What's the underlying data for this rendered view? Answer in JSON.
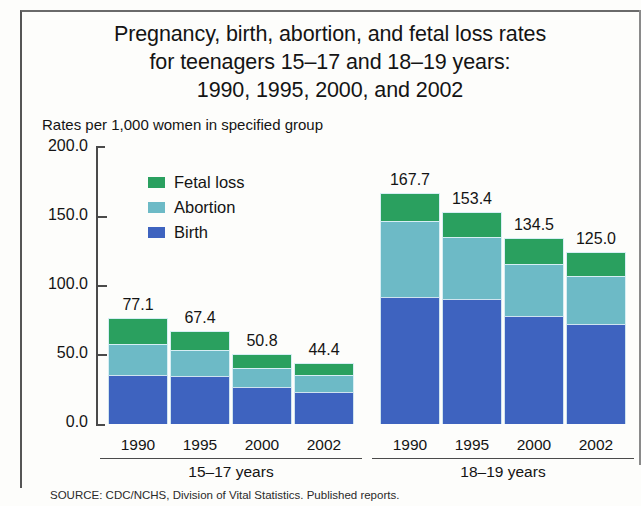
{
  "figure": {
    "title_lines": [
      "Pregnancy, birth, abortion, and fetal loss rates",
      "for teenagers 15–17 and 18–19 years:",
      "1990, 1995, 2000, and 2002"
    ],
    "subtitle": "Rates per 1,000 women in specified group",
    "source": "SOURCE: CDC/NCHS, Division of Vital Statistics. Published reports."
  },
  "legend": {
    "position": "inside-top-left",
    "items": [
      {
        "label": "Fetal loss",
        "color": "#2aa05f"
      },
      {
        "label": "Abortion",
        "color": "#6dbac6"
      },
      {
        "label": "Birth",
        "color": "#3e63bf"
      }
    ]
  },
  "axis": {
    "y_ticks": [
      "200.0",
      "150.0",
      "100.0",
      "50.0",
      "0.0"
    ],
    "y_values": [
      200,
      150,
      100,
      50,
      0
    ]
  },
  "groups": [
    {
      "label": "15–17 years",
      "years": [
        "1990",
        "1995",
        "2000",
        "2002"
      ]
    },
    {
      "label": "18–19 years",
      "years": [
        "1990",
        "1995",
        "2000",
        "2002"
      ]
    }
  ],
  "bars": [
    {
      "group": "15–17 years",
      "year": "1990",
      "total": "77.1",
      "birth": 35.5,
      "abortion": 22.2,
      "fetal_loss": 19.4
    },
    {
      "group": "15–17 years",
      "year": "1995",
      "total": "67.4",
      "birth": 35.1,
      "abortion": 18.8,
      "fetal_loss": 13.5
    },
    {
      "group": "15–17 years",
      "year": "2000",
      "total": "50.8",
      "birth": 26.9,
      "abortion": 13.8,
      "fetal_loss": 10.1
    },
    {
      "group": "15–17 years",
      "year": "2002",
      "total": "44.4",
      "birth": 23.2,
      "abortion": 12.3,
      "fetal_loss": 8.9
    },
    {
      "group": "18–19 years",
      "year": "1990",
      "total": "167.7",
      "birth": 92.0,
      "abortion": 55.3,
      "fetal_loss": 20.4
    },
    {
      "group": "18–19 years",
      "year": "1995",
      "total": "153.4",
      "birth": 90.6,
      "abortion": 44.8,
      "fetal_loss": 18.0
    },
    {
      "group": "18–19 years",
      "year": "2000",
      "total": "134.5",
      "birth": 78.1,
      "abortion": 38.0,
      "fetal_loss": 18.4
    },
    {
      "group": "18–19 years",
      "year": "2002",
      "total": "125.0",
      "birth": 72.2,
      "abortion": 35.2,
      "fetal_loss": 17.6
    }
  ],
  "chart_data": {
    "type": "bar",
    "subtype": "stacked",
    "title": "Pregnancy, birth, abortion, and fetal loss rates for teenagers 15–17 and 18–19 years: 1990, 1995, 2000, and 2002",
    "subtitle": "Rates per 1,000 women in specified group",
    "xlabel": "",
    "ylabel": "Rates per 1,000 women in specified group",
    "ylim": [
      0,
      200
    ],
    "ytick_labels": [
      "0.0",
      "50.0",
      "100.0",
      "150.0",
      "200.0"
    ],
    "grid": false,
    "legend": [
      "Fetal loss",
      "Abortion",
      "Birth"
    ],
    "legend_position": "upper left inside",
    "group_labels": [
      "15–17 years",
      "18–19 years"
    ],
    "categories": [
      "15–17 1990",
      "15–17 1995",
      "15–17 2000",
      "15–17 2002",
      "18–19 1990",
      "18–19 1995",
      "18–19 2000",
      "18–19 2002"
    ],
    "series": [
      {
        "name": "Birth",
        "color": "#3e63bf",
        "values": [
          35.5,
          35.1,
          26.9,
          23.2,
          92.0,
          90.6,
          78.1,
          72.2
        ]
      },
      {
        "name": "Abortion",
        "color": "#6dbac6",
        "values": [
          22.2,
          18.8,
          13.8,
          12.3,
          55.3,
          44.8,
          38.0,
          35.2
        ]
      },
      {
        "name": "Fetal loss",
        "color": "#2aa05f",
        "values": [
          19.4,
          13.5,
          10.1,
          8.9,
          20.4,
          18.0,
          18.4,
          17.6
        ]
      }
    ],
    "totals": [
      77.1,
      67.4,
      50.8,
      44.4,
      167.7,
      153.4,
      134.5,
      125.0
    ],
    "data_labels": [
      "77.1",
      "67.4",
      "50.8",
      "44.4",
      "167.7",
      "153.4",
      "134.5",
      "125.0"
    ],
    "source": "SOURCE: CDC/NCHS, Division of Vital Statistics. Published reports."
  }
}
